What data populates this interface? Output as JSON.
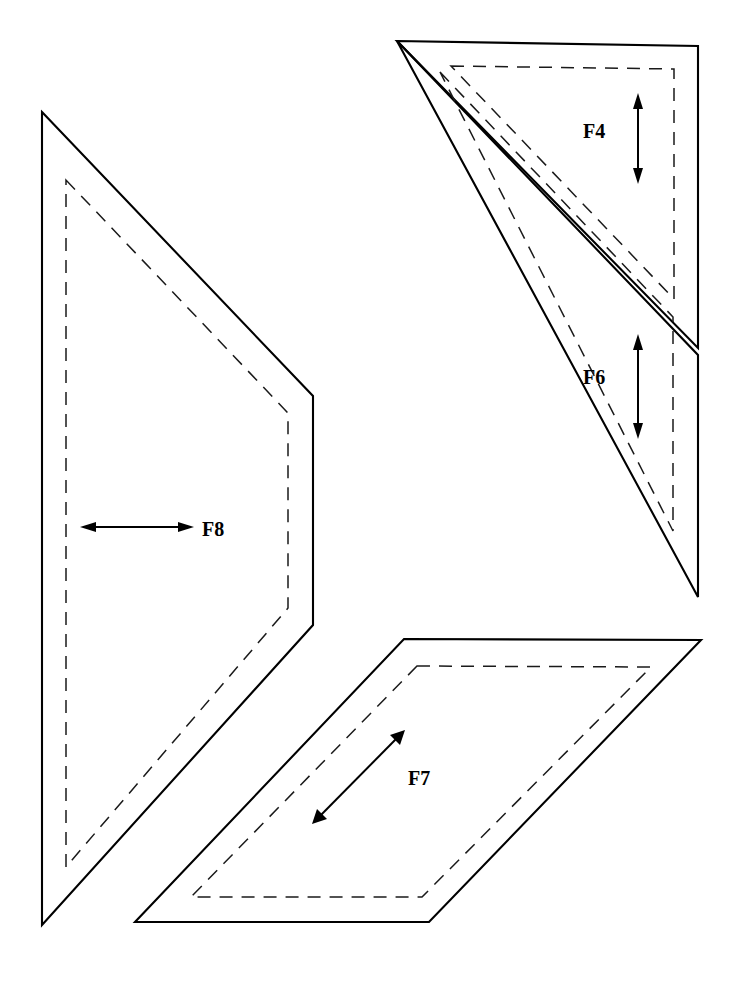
{
  "document": {
    "title": "Pattern Pieces Layout",
    "background_color": "#ffffff",
    "line_color": "#000000",
    "width": 734,
    "height": 982
  },
  "legend": {
    "cut_line_style": "solid",
    "seam_line_style": "dashed",
    "arrow_meaning": "grain direction"
  },
  "pieces": [
    {
      "id": "F4",
      "label": "F4",
      "shape": "right-triangle",
      "label_x": 601,
      "label_y": 132,
      "arrow": {
        "type": "double-arrow",
        "orientation": "vertical",
        "x1": 638,
        "y1": 95,
        "x2": 638,
        "y2": 182
      },
      "cut_path": "M 397 41 L 698 46 L 698 348 Z",
      "seam_path": "M 451 66 L 674 69 L 674 299 Z"
    },
    {
      "id": "F6",
      "label": "F6",
      "shape": "right-triangle",
      "label_x": 601,
      "label_y": 378,
      "arrow": {
        "type": "double-arrow",
        "orientation": "vertical",
        "x1": 638,
        "y1": 336,
        "x2": 638,
        "y2": 437
      },
      "cut_path": "M 397 41 L 698 355 L 698 597 Z",
      "seam_path": "M 440 72 L 673 317 L 673 531 Z"
    },
    {
      "id": "F7",
      "label": "F7",
      "shape": "parallelogram",
      "label_x": 426,
      "label_y": 779,
      "arrow": {
        "type": "double-arrow",
        "orientation": "diagonal-up-right",
        "x1": 313,
        "y1": 823,
        "x2": 404,
        "y2": 731
      },
      "cut_path": "M 404 639 L 701 640 L 429 922 L 135 922 Z",
      "seam_path": "M 417 666 L 651 667 L 422 897 L 191 897 Z"
    },
    {
      "id": "F8",
      "label": "F8",
      "shape": "pentagon",
      "label_x": 202,
      "label_y": 530,
      "arrow": {
        "type": "double-arrow",
        "orientation": "horizontal",
        "x1": 82,
        "y1": 527,
        "x2": 192,
        "y2": 527
      },
      "cut_path": "M 42 112 L 313 396 L 313 625 L 42 925 Z",
      "seam_path": "M 66 180 L 288 413 L 288 608 L 66 867 Z"
    }
  ]
}
